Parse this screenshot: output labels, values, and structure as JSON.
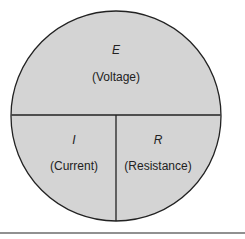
{
  "diagram": {
    "colors": {
      "fill": "#d4d4d4",
      "stroke": "#222222",
      "background": "#ffffff"
    },
    "top": {
      "symbol": "E",
      "label": "(Voltage)"
    },
    "bottom_left": {
      "symbol": "I",
      "label": "(Current)"
    },
    "bottom_right": {
      "symbol": "R",
      "label": "(Resistance)"
    }
  }
}
